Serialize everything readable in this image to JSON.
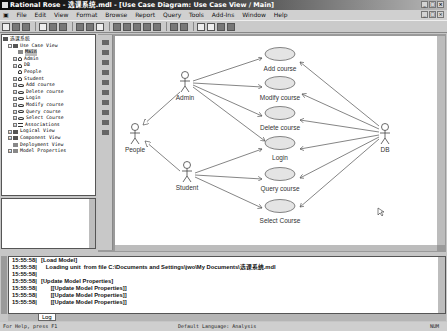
{
  "window": {
    "title": "Rational Rose - 选课系统.mdl - [Use Case Diagram: Use Case View / Main]",
    "controls": [
      "_",
      "□",
      "×"
    ]
  },
  "menu": {
    "items": [
      "File",
      "Edit",
      "View",
      "Format",
      "Browse",
      "Report",
      "Query",
      "Tools",
      "Add-Ins",
      "Window",
      "Help"
    ]
  },
  "browser": {
    "root": "选课系统",
    "items": [
      {
        "label": "Use Case View",
        "indent": 1,
        "icon": "folder",
        "exp": "-"
      },
      {
        "label": "Main",
        "indent": 2,
        "icon": "diag",
        "exp": "",
        "selected": true
      },
      {
        "label": "Admin",
        "indent": 2,
        "icon": "actor",
        "exp": "+"
      },
      {
        "label": "DB",
        "indent": 2,
        "icon": "actor",
        "exp": "+"
      },
      {
        "label": "People",
        "indent": 2,
        "icon": "actor",
        "exp": ""
      },
      {
        "label": "Student",
        "indent": 2,
        "icon": "actor",
        "exp": "+"
      },
      {
        "label": "Add course",
        "indent": 2,
        "icon": "uc",
        "exp": "+"
      },
      {
        "label": "Delete course",
        "indent": 2,
        "icon": "uc",
        "exp": "+"
      },
      {
        "label": "Login",
        "indent": 2,
        "icon": "uc",
        "exp": "+"
      },
      {
        "label": "Modify course",
        "indent": 2,
        "icon": "uc",
        "exp": "+"
      },
      {
        "label": "Query course",
        "indent": 2,
        "icon": "uc",
        "exp": "+"
      },
      {
        "label": "Select Course",
        "indent": 2,
        "icon": "uc",
        "exp": "+"
      },
      {
        "label": "Associations",
        "indent": 2,
        "icon": "assoc",
        "exp": "+"
      },
      {
        "label": "Logical View",
        "indent": 1,
        "icon": "folder",
        "exp": "+"
      },
      {
        "label": "Component View",
        "indent": 1,
        "icon": "folder",
        "exp": "+"
      },
      {
        "label": "Deployment View",
        "indent": 1,
        "icon": "diag",
        "exp": ""
      },
      {
        "label": "Model Properties",
        "indent": 1,
        "icon": "diag",
        "exp": "+"
      }
    ]
  },
  "diagram": {
    "actors": [
      {
        "name": "Admin",
        "x": 70,
        "y": 45
      },
      {
        "name": "People",
        "x": 20,
        "y": 97
      },
      {
        "name": "Student",
        "x": 72,
        "y": 135
      },
      {
        "name": "DB",
        "x": 270,
        "y": 97
      }
    ],
    "use_cases": [
      {
        "name": "Add course",
        "x": 165,
        "y": 18
      },
      {
        "name": "Modify course",
        "x": 165,
        "y": 47
      },
      {
        "name": "Delete course",
        "x": 165,
        "y": 77
      },
      {
        "name": "Login",
        "x": 165,
        "y": 107
      },
      {
        "name": "Query course",
        "x": 165,
        "y": 138
      },
      {
        "name": "Select Course",
        "x": 165,
        "y": 170
      }
    ]
  },
  "log": {
    "rows": [
      {
        "ts": "15:55:58|",
        "msg": "[Load Model]"
      },
      {
        "ts": "15:55:58|",
        "msg": "   Loading unit  from file C:\\Documents and Settings\\jwo\\My Documents\\选课系统.mdl"
      },
      {
        "ts": "15:55:58|",
        "msg": ""
      },
      {
        "ts": "15:55:58|",
        "msg": "[Update Model Properties]"
      },
      {
        "ts": "15:55:58|",
        "msg": "      [[Update Model Properties]]"
      },
      {
        "ts": "15:55:58|",
        "msg": "      [[Update Model Properties]]"
      },
      {
        "ts": "15:55:58|",
        "msg": "      [[Update Model Properties]]"
      }
    ],
    "tab": "Log"
  },
  "status": {
    "left": "For Help, press F1",
    "middle": "Default Language: Analysis",
    "right": "NUM"
  }
}
